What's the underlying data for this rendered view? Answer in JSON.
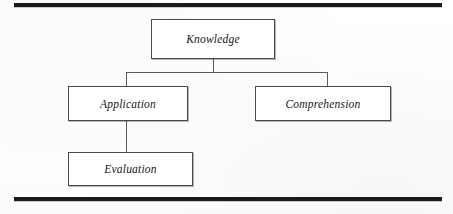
{
  "figure": {
    "type": "hierarchy-diagram",
    "nodes": [
      {
        "id": "knowledge",
        "label": "Knowledge"
      },
      {
        "id": "application",
        "label": "Application"
      },
      {
        "id": "comprehension",
        "label": "Comprehension"
      },
      {
        "id": "evaluation",
        "label": "Evaluation"
      }
    ],
    "edges": [
      {
        "from": "knowledge",
        "to": "application"
      },
      {
        "from": "knowledge",
        "to": "comprehension"
      },
      {
        "from": "application",
        "to": "evaluation"
      }
    ],
    "colors": {
      "rule": "#1a1a1a",
      "box_border": "#4a4a4a",
      "connector": "#5a5a5a",
      "text": "#171717",
      "background": "#fefefe"
    }
  }
}
